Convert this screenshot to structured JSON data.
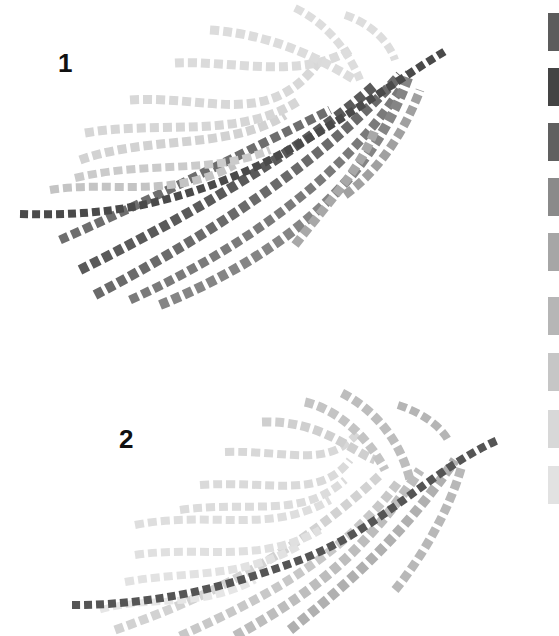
{
  "figures": [
    {
      "label": "1",
      "stem": {
        "d": "M20,214 C90,216 150,210 230,178 S380,90 447,50",
        "color": "#4a4a4a",
        "width": 8
      },
      "fronds": [
        {
          "d": "M60,240 C140,205 250,150 330,110",
          "color": "#6e6e6e",
          "width": 9
        },
        {
          "d": "M80,270 C170,225 290,160 375,85",
          "color": "#5a5a5a",
          "width": 10
        },
        {
          "d": "M95,295 C200,240 320,165 400,75",
          "color": "#6a6a6a",
          "width": 10
        },
        {
          "d": "M130,300 C240,250 340,180 400,90",
          "color": "#7a7a7a",
          "width": 9
        },
        {
          "d": "M160,305 C270,260 370,190 410,72",
          "color": "#858585",
          "width": 10
        },
        {
          "d": "M295,245 C330,200 360,170 375,130",
          "color": "#a8a8a8",
          "width": 9
        },
        {
          "d": "M345,195 C380,170 405,130 420,90",
          "color": "#a0a0a0",
          "width": 9
        },
        {
          "d": "M50,190 C110,180 170,200 235,165",
          "color": "#c4c4c4",
          "width": 8
        },
        {
          "d": "M75,178 C150,160 210,175 270,150",
          "color": "#cbcbcb",
          "width": 8
        },
        {
          "d": "M80,160 C150,135 230,150 285,115",
          "color": "#d2d2d2",
          "width": 9
        },
        {
          "d": "M85,133 C160,120 240,140 300,100",
          "color": "#d6d6d6",
          "width": 9
        },
        {
          "d": "M130,100 C210,95 270,130 320,60",
          "color": "#d8d8d8",
          "width": 9
        },
        {
          "d": "M175,63 C230,60 300,80 350,50",
          "color": "#dbdbdb",
          "width": 9
        },
        {
          "d": "M210,30 C280,35 330,65 355,80",
          "color": "#dcdcdc",
          "width": 9
        },
        {
          "d": "M295,8 C330,25 350,55 360,80",
          "color": "#dddddd",
          "width": 8
        },
        {
          "d": "M345,15 C375,25 390,45 395,60",
          "color": "#dddddd",
          "width": 8
        }
      ]
    },
    {
      "label": "2",
      "stem": {
        "d": "M72,605 C150,605 220,590 300,560 S430,470 498,440",
        "color": "#555555",
        "width": 8
      },
      "fronds": [
        {
          "d": "M115,630 C200,600 290,560 380,475",
          "color": "#d2d2d2",
          "width": 9
        },
        {
          "d": "M180,636 C260,600 340,560 400,480",
          "color": "#c8c8c8",
          "width": 9
        },
        {
          "d": "M235,636 C300,600 360,560 420,470",
          "color": "#bdbdbd",
          "width": 10
        },
        {
          "d": "M290,630 C340,590 400,540 455,460",
          "color": "#b0b0b0",
          "width": 10
        },
        {
          "d": "M395,590 C420,560 450,510 462,465",
          "color": "#b8b8b8",
          "width": 9
        },
        {
          "d": "M100,610 C150,595 200,610 255,580",
          "color": "#e6e6e6",
          "width": 7
        },
        {
          "d": "M125,582 C190,570 240,580 300,545",
          "color": "#e2e2e2",
          "width": 8
        },
        {
          "d": "M135,555 C200,545 260,565 320,530",
          "color": "#e0e0e0",
          "width": 8
        },
        {
          "d": "M135,525 C210,510 270,535 330,500",
          "color": "#dedede",
          "width": 8
        },
        {
          "d": "M180,510 C250,500 300,520 345,480",
          "color": "#dcdcdc",
          "width": 8
        },
        {
          "d": "M200,485 C270,480 320,500 350,460",
          "color": "#dadada",
          "width": 8
        },
        {
          "d": "M225,452 C290,450 330,470 360,430",
          "color": "#d8d8d8",
          "width": 8
        },
        {
          "d": "M262,422 C320,420 350,450 375,460",
          "color": "#cfcfcf",
          "width": 9
        },
        {
          "d": "M305,402 C340,410 370,440 385,470",
          "color": "#c4c4c4",
          "width": 9
        },
        {
          "d": "M342,393 C375,410 400,440 410,480",
          "color": "#bdbdbd",
          "width": 9
        },
        {
          "d": "M398,405 C420,412 440,425 448,440",
          "color": "#b5b5b5",
          "width": 8
        }
      ]
    }
  ],
  "swatches": [
    {
      "color": "#5c5c5c",
      "top": 13
    },
    {
      "color": "#444444",
      "top": 68
    },
    {
      "color": "#606060",
      "top": 123
    },
    {
      "color": "#8a8a8a",
      "top": 178
    },
    {
      "color": "#a6a6a6",
      "top": 233
    },
    {
      "color": "#b6b6b6",
      "top": 297
    },
    {
      "color": "#c6c6c6",
      "top": 353
    },
    {
      "color": "#d8d8d8",
      "top": 410
    },
    {
      "color": "#e2e2e2",
      "top": 466
    }
  ]
}
